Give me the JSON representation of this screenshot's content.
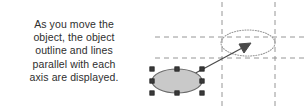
{
  "caption": {
    "text": "As you move the\nobject, the object\noutline and lines\nparallel with each\naxis are displayed.",
    "align": "center",
    "color": "#2e2e2e"
  },
  "diagram": {
    "canvas": {
      "width": 308,
      "height": 111,
      "background": "#ffffff"
    },
    "colors": {
      "object_fill": "#c9c9c9",
      "object_stroke": "#6b6b6b",
      "handle_fill": "#3a3a3a",
      "handle_stroke": "#1a1a1a",
      "guide_line": "#8a8a8a",
      "outline_preview": "#9a9a9a",
      "arrow": "#4a4a4a"
    },
    "source_object": {
      "name": "selected-ellipse",
      "shape": "ellipse",
      "cx": 177,
      "cy": 81,
      "rx": 25,
      "ry": 12,
      "fill": "#c9c9c9",
      "stroke": "#6b6b6b",
      "selected": true,
      "handle_count": 8,
      "handle_size": 4.4,
      "handles": [
        {
          "name": "handle-top-left",
          "x": 152,
          "y": 69
        },
        {
          "name": "handle-top-center",
          "x": 177,
          "y": 69
        },
        {
          "name": "handle-top-right",
          "x": 202,
          "y": 69
        },
        {
          "name": "handle-middle-left",
          "x": 152,
          "y": 81
        },
        {
          "name": "handle-middle-right",
          "x": 202,
          "y": 81
        },
        {
          "name": "handle-bottom-left",
          "x": 152,
          "y": 93
        },
        {
          "name": "handle-bottom-center",
          "x": 177,
          "y": 93
        },
        {
          "name": "handle-bottom-right",
          "x": 202,
          "y": 93
        }
      ]
    },
    "outline_preview": {
      "name": "ghost-outline-ellipse",
      "shape": "ellipse",
      "cx": 248,
      "cy": 43,
      "rx": 27,
      "ry": 13,
      "fill": "none",
      "stroke": "#9a9a9a",
      "stroke_style": "dotted"
    },
    "move_arrow": {
      "name": "move-direction-arrow",
      "from_x": 177,
      "from_y": 83,
      "to_x": 249,
      "to_y": 44,
      "stroke": "#4a4a4a",
      "head": "filled-triangle"
    },
    "guides": [
      {
        "name": "guide-vertical-left",
        "orientation": "vertical",
        "x": 222,
        "y1": 2,
        "y2": 109
      },
      {
        "name": "guide-vertical-right",
        "orientation": "vertical",
        "x": 275,
        "y1": 2,
        "y2": 109
      },
      {
        "name": "guide-horizontal-top",
        "orientation": "horizontal",
        "y": 37,
        "x1": 155,
        "x2": 306
      },
      {
        "name": "guide-horizontal-bottom",
        "orientation": "horizontal",
        "y": 58,
        "x1": 155,
        "x2": 306
      }
    ],
    "guide_dash": "5,4"
  }
}
